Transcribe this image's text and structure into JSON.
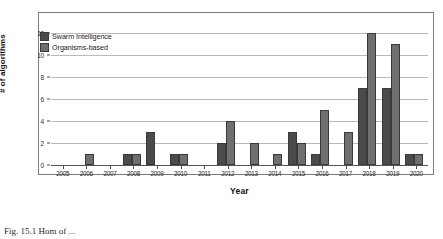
{
  "chart_data": {
    "type": "bar",
    "title": "",
    "xlabel": "Year",
    "ylabel": "# of algorithms",
    "categories": [
      "2005",
      "2006",
      "2007",
      "2008",
      "2009",
      "2010",
      "2011",
      "2012",
      "2013",
      "2014",
      "2015",
      "2016",
      "2017",
      "2018",
      "2019",
      "2020"
    ],
    "series": [
      {
        "name": "Swarm Intelligence",
        "color": "#4b4b4b",
        "values": [
          0,
          0,
          0,
          1,
          3,
          1,
          0,
          2,
          0,
          0,
          3,
          1,
          0,
          7,
          7,
          1
        ]
      },
      {
        "name": "Organisms-based",
        "color": "#6f6f6f",
        "values": [
          0,
          1,
          0,
          1,
          0,
          1,
          0,
          4,
          2,
          1,
          2,
          5,
          3,
          12,
          11,
          1
        ]
      }
    ],
    "ylim": [
      0,
      13
    ],
    "yticks": [
      0,
      2,
      4,
      6,
      8,
      10,
      12
    ],
    "ytick_labels": [
      "0",
      "2",
      "4",
      "6",
      "8",
      "10",
      "12"
    ],
    "grid": true,
    "legend_position": "top-left"
  },
  "legend": {
    "entries": [
      {
        "label": "Swarm Intelligence"
      },
      {
        "label": "Organisms-based"
      }
    ]
  },
  "caption": {
    "text": "Fig. 15.1   Hom of ..."
  }
}
